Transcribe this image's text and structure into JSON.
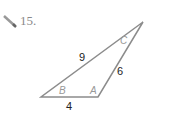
{
  "problem": {
    "number": "15.",
    "icon": "pencil-icon"
  },
  "triangle": {
    "vertices": {
      "B": [
        41,
        97
      ],
      "A": [
        98,
        97
      ],
      "C": [
        143,
        22
      ]
    },
    "angle_labels": [
      "B",
      "A",
      "C"
    ],
    "sides": {
      "BC": "9",
      "AC": "6",
      "AB": "4"
    },
    "stroke_color": "#8c8c8c"
  }
}
